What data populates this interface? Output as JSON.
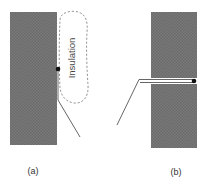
{
  "diagram": {
    "panels": [
      {
        "id": "a",
        "label": "(a)",
        "insulation_label": "Insulation",
        "description": "Sensor wire attached to block surface, covered by insulation"
      },
      {
        "id": "b",
        "label": "(b)",
        "description": "Sensor wire inserted through slot into block"
      }
    ],
    "colors": {
      "block_fill": "#7a7a7a",
      "block_pattern": "#5e5e5e",
      "wire": "#555555",
      "junction": "#111111",
      "insulation_outline": "#8a8a8a"
    }
  }
}
